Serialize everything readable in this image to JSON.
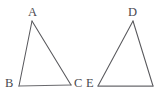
{
  "figure": {
    "background_color": "#ffffff",
    "stroke_color": "#58585c",
    "label_color": "#4b4b50",
    "width": 161,
    "height": 100,
    "shapes": [
      {
        "name": "triangle-abc",
        "vertices": [
          {
            "label": "A",
            "x": 32,
            "y": 21
          },
          {
            "label": "B",
            "x": 19,
            "y": 86
          },
          {
            "label": "C",
            "x": 71,
            "y": 85
          }
        ],
        "labels": [
          {
            "text": "A",
            "x": 28,
            "y": 6
          },
          {
            "text": "B",
            "x": 5,
            "y": 77
          },
          {
            "text": "C",
            "x": 74,
            "y": 77
          }
        ]
      },
      {
        "name": "triangle-de",
        "vertices": [
          {
            "label": "D",
            "x": 133,
            "y": 21
          },
          {
            "label": "E",
            "x": 98,
            "y": 86
          },
          {
            "label": "",
            "x": 153,
            "y": 86
          }
        ],
        "labels": [
          {
            "text": "D",
            "x": 128,
            "y": 6
          },
          {
            "text": "E",
            "x": 86,
            "y": 77
          }
        ]
      }
    ]
  },
  "labels": {
    "a": "A",
    "b": "B",
    "c": "C",
    "d": "D",
    "e": "E"
  }
}
